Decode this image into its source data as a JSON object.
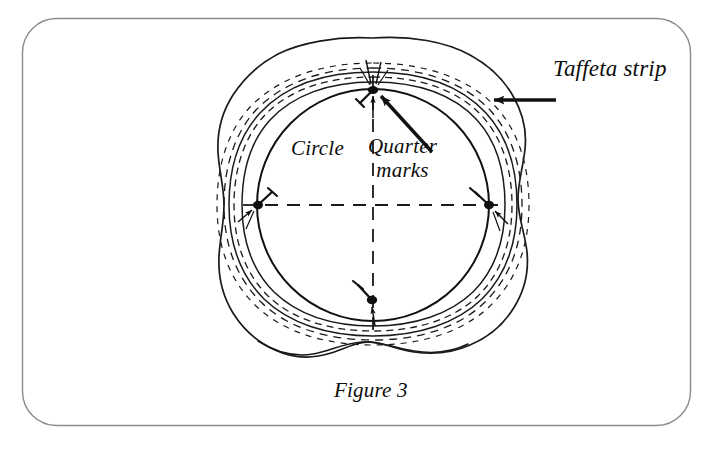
{
  "figure": {
    "caption": "Figure 3",
    "labels": {
      "taffeta_strip": "Taffeta strip",
      "circle": "Circle",
      "quarter_marks_line1": "Quarter",
      "quarter_marks_line2": "marks"
    },
    "colors": {
      "background": "#ffffff",
      "ink": "#111111",
      "frame_border": "#8a8a8a",
      "dashed_guide": "#1a1a1a"
    },
    "geometry": {
      "center_x": 373,
      "center_y": 205,
      "circle_radius": 116,
      "quarter_mark_count": 4,
      "quarter_mark_positions": [
        "top",
        "right",
        "bottom",
        "left"
      ]
    },
    "annotations": [
      {
        "name": "taffeta-strip-arrow",
        "points_to": "outer fabric strip edge",
        "direction": "right-to-left"
      },
      {
        "name": "quarter-marks-arrow",
        "points_to": "top quarter mark pin",
        "direction": "lower-right-to-upper-left"
      }
    ]
  }
}
